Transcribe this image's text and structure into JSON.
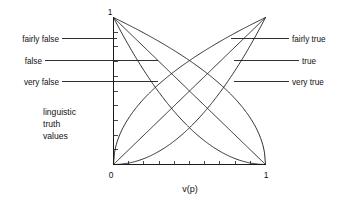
{
  "figure": {
    "title": "linguistic truth values",
    "background_color": "#ffffff",
    "line_color": "#1a1a1a"
  },
  "axes": {
    "x_title": "v(p)",
    "x_min_label": "0",
    "x_max_label": "1",
    "y_max_label": "1",
    "y_min_label": "0",
    "x_ticks_count": 9,
    "y_ticks_count": 9
  },
  "block_label": {
    "line1": "linguistic",
    "line2": "truth",
    "line3": "values"
  },
  "left_labels": [
    {
      "text": "fairly false"
    },
    {
      "text": "false"
    },
    {
      "text": "very false"
    }
  ],
  "right_labels": [
    {
      "text": "fairly true"
    },
    {
      "text": "true"
    },
    {
      "text": "very true"
    }
  ],
  "chart_data": {
    "type": "line",
    "title": "linguistic truth values",
    "xlabel": "v(p)",
    "ylabel": "",
    "xlim": [
      0,
      1
    ],
    "ylim": [
      0,
      1
    ],
    "grid": false,
    "legend_position": "inline-leader-labels",
    "x_tick_labels": [
      "0",
      "1"
    ],
    "y_tick_labels": [
      "0",
      "1"
    ],
    "x": [
      0,
      0.05,
      0.1,
      0.15,
      0.2,
      0.25,
      0.3,
      0.35,
      0.4,
      0.45,
      0.5,
      0.55,
      0.6,
      0.65,
      0.7,
      0.75,
      0.8,
      0.85,
      0.9,
      0.95,
      1
    ],
    "series": [
      {
        "name": "fairly true",
        "formula": "sqrt(v)",
        "side": "right",
        "values": [
          0,
          0.224,
          0.316,
          0.387,
          0.447,
          0.5,
          0.548,
          0.592,
          0.632,
          0.671,
          0.707,
          0.742,
          0.775,
          0.806,
          0.837,
          0.866,
          0.894,
          0.922,
          0.949,
          0.975,
          1
        ]
      },
      {
        "name": "true",
        "formula": "v",
        "side": "right",
        "values": [
          0,
          0.05,
          0.1,
          0.15,
          0.2,
          0.25,
          0.3,
          0.35,
          0.4,
          0.45,
          0.5,
          0.55,
          0.6,
          0.65,
          0.7,
          0.75,
          0.8,
          0.85,
          0.9,
          0.95,
          1
        ]
      },
      {
        "name": "very true",
        "formula": "v^2",
        "side": "right",
        "values": [
          0,
          0.0025,
          0.01,
          0.0225,
          0.04,
          0.0625,
          0.09,
          0.1225,
          0.16,
          0.2025,
          0.25,
          0.3025,
          0.36,
          0.4225,
          0.49,
          0.5625,
          0.64,
          0.7225,
          0.81,
          0.9025,
          1
        ]
      },
      {
        "name": "fairly false",
        "formula": "sqrt(1-v)",
        "side": "left",
        "values": [
          1,
          0.975,
          0.949,
          0.922,
          0.894,
          0.866,
          0.837,
          0.806,
          0.775,
          0.742,
          0.707,
          0.671,
          0.632,
          0.592,
          0.548,
          0.5,
          0.447,
          0.387,
          0.316,
          0.224,
          0
        ]
      },
      {
        "name": "false",
        "formula": "1-v",
        "side": "left",
        "values": [
          1,
          0.95,
          0.9,
          0.85,
          0.8,
          0.75,
          0.7,
          0.65,
          0.6,
          0.55,
          0.5,
          0.45,
          0.4,
          0.35,
          0.3,
          0.25,
          0.2,
          0.15,
          0.1,
          0.05,
          0
        ]
      },
      {
        "name": "very false",
        "formula": "(1-v)^2",
        "side": "left",
        "values": [
          1,
          0.9025,
          0.81,
          0.7225,
          0.64,
          0.5625,
          0.49,
          0.4225,
          0.36,
          0.3025,
          0.25,
          0.2025,
          0.16,
          0.1225,
          0.09,
          0.0625,
          0.04,
          0.0225,
          0.01,
          0.0025,
          0
        ]
      }
    ]
  }
}
